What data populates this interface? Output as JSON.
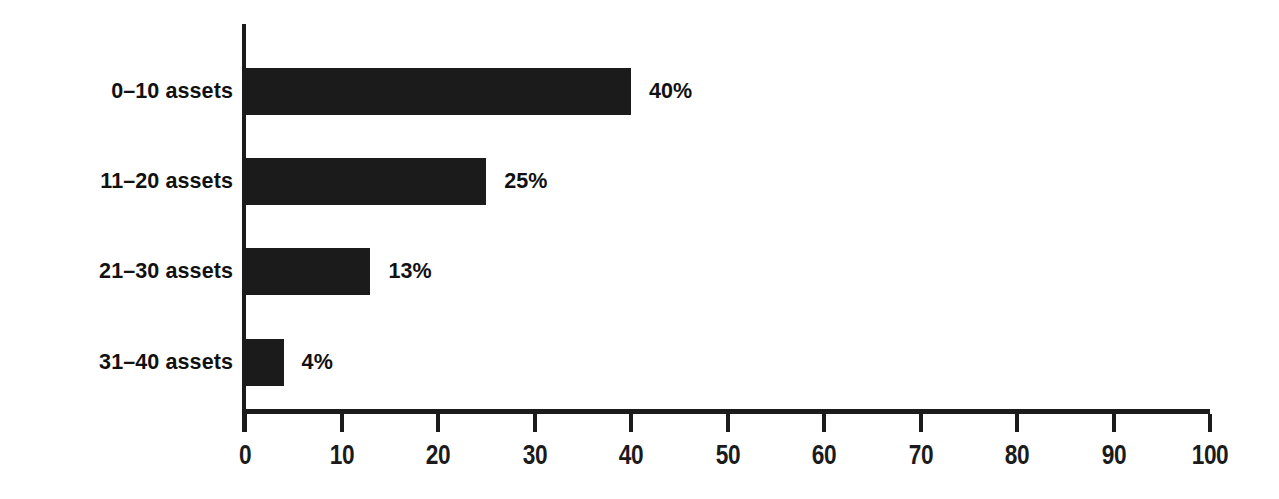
{
  "chart_data": {
    "type": "bar",
    "orientation": "horizontal",
    "title": "",
    "subtitle": "",
    "xlabel": "",
    "ylabel": "",
    "categories": [
      "0–10 assets",
      "11–20 assets",
      "21–30 assets",
      "31–40 assets"
    ],
    "values": [
      40,
      25,
      13,
      4
    ],
    "data_labels": [
      "40%",
      "25%",
      "13%",
      "4%"
    ],
    "xlim": [
      0,
      100
    ],
    "xticks": [
      0,
      10,
      20,
      30,
      40,
      50,
      60,
      70,
      80,
      90,
      100
    ],
    "xtick_labels": [
      "0",
      "10",
      "20",
      "30",
      "40",
      "50",
      "60",
      "70",
      "80",
      "90",
      "100"
    ],
    "grid": false,
    "legend": null,
    "legend_position": "none",
    "bar_color": "#1b1b1b",
    "axis_color": "#1b1b1b",
    "background_color": "#ffffff",
    "text_color": "#111111"
  }
}
